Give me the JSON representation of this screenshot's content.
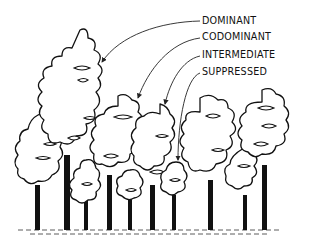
{
  "diagram": {
    "labels": [
      {
        "id": "dominant",
        "text": "DOMINANT"
      },
      {
        "id": "codominant",
        "text": "CODOMINANT"
      },
      {
        "id": "intermediate",
        "text": "INTERMEDIATE"
      },
      {
        "id": "suppressed",
        "text": "SUPPRESSED"
      }
    ],
    "colors": {
      "ink": "#111111",
      "background": "#ffffff"
    }
  }
}
